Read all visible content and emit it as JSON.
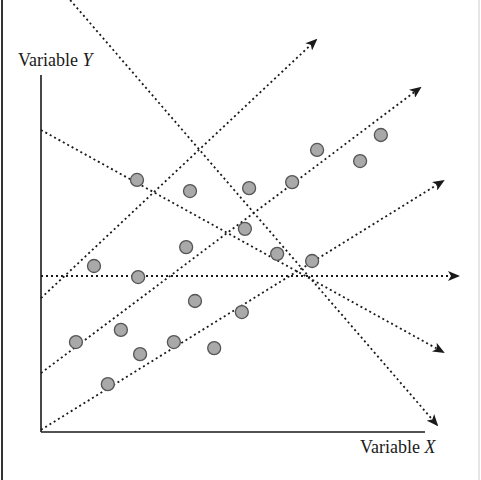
{
  "diagram": {
    "type": "scatter-with-projection-directions",
    "y_axis_label": {
      "text": "Variable ",
      "var": "Y"
    },
    "x_axis_label": {
      "text": "Variable ",
      "var": "X"
    },
    "colors": {
      "point_fill": "#a9a9a9",
      "point_stroke": "#555555",
      "axis": "#1a1a1a",
      "dotted_line": "#1a1a1a",
      "frame_left": "#333333",
      "frame_right": "#cccccc"
    },
    "points": [
      {
        "x": 0.25,
        "y": 0.706
      },
      {
        "x": 0.388,
        "y": 0.675
      },
      {
        "x": 0.542,
        "y": 0.683
      },
      {
        "x": 0.654,
        "y": 0.7
      },
      {
        "x": 0.719,
        "y": 0.79
      },
      {
        "x": 0.831,
        "y": 0.759
      },
      {
        "x": 0.885,
        "y": 0.832
      },
      {
        "x": 0.138,
        "y": 0.465
      },
      {
        "x": 0.253,
        "y": 0.434
      },
      {
        "x": 0.378,
        "y": 0.518
      },
      {
        "x": 0.531,
        "y": 0.569
      },
      {
        "x": 0.615,
        "y": 0.499
      },
      {
        "x": 0.706,
        "y": 0.479
      },
      {
        "x": 0.091,
        "y": 0.252
      },
      {
        "x": 0.208,
        "y": 0.286
      },
      {
        "x": 0.258,
        "y": 0.218
      },
      {
        "x": 0.346,
        "y": 0.252
      },
      {
        "x": 0.401,
        "y": 0.367
      },
      {
        "x": 0.451,
        "y": 0.235
      },
      {
        "x": 0.523,
        "y": 0.336
      },
      {
        "x": 0.174,
        "y": 0.134
      }
    ],
    "direction_lines": [
      {
        "name": "steep-descending",
        "from": {
          "x": 0.076,
          "y": 1.21
        },
        "to": {
          "x": 1.031,
          "y": 0.02
        }
      },
      {
        "name": "shallow-descending",
        "from": {
          "x": 0.0,
          "y": 0.846
        },
        "to": {
          "x": 1.047,
          "y": 0.224
        }
      },
      {
        "name": "horizontal",
        "from": {
          "x": 0.0,
          "y": 0.437
        },
        "to": {
          "x": 1.086,
          "y": 0.437
        }
      },
      {
        "name": "upper-ascending",
        "from": {
          "x": 0.0,
          "y": 0.375
        },
        "to": {
          "x": 0.716,
          "y": 1.098
        }
      },
      {
        "name": "middle-ascending",
        "from": {
          "x": 0.0,
          "y": 0.165
        },
        "to": {
          "x": 0.987,
          "y": 0.964
        }
      },
      {
        "name": "lower-ascending",
        "from": {
          "x": 0.0,
          "y": 0.006
        },
        "to": {
          "x": 1.047,
          "y": 0.703
        }
      }
    ]
  }
}
